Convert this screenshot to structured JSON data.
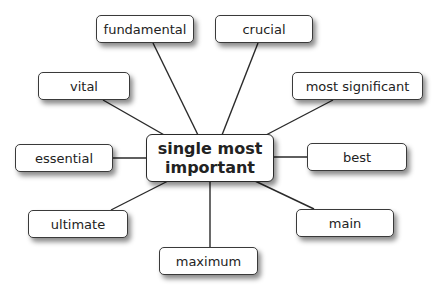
{
  "diagram": {
    "type": "mind-map",
    "center": {
      "label": "single most important"
    },
    "nodes": [
      {
        "id": "fundamental",
        "label": "fundamental"
      },
      {
        "id": "crucial",
        "label": "crucial"
      },
      {
        "id": "vital",
        "label": "vital"
      },
      {
        "id": "most_significant",
        "label": "most significant"
      },
      {
        "id": "essential",
        "label": "essential"
      },
      {
        "id": "best",
        "label": "best"
      },
      {
        "id": "ultimate",
        "label": "ultimate"
      },
      {
        "id": "main",
        "label": "main"
      },
      {
        "id": "maximum",
        "label": "maximum"
      }
    ],
    "colors": {
      "line": "#2a2a2a",
      "box_border": "#3a3a3a",
      "box_fill": "#ffffff",
      "text": "#222222"
    }
  }
}
